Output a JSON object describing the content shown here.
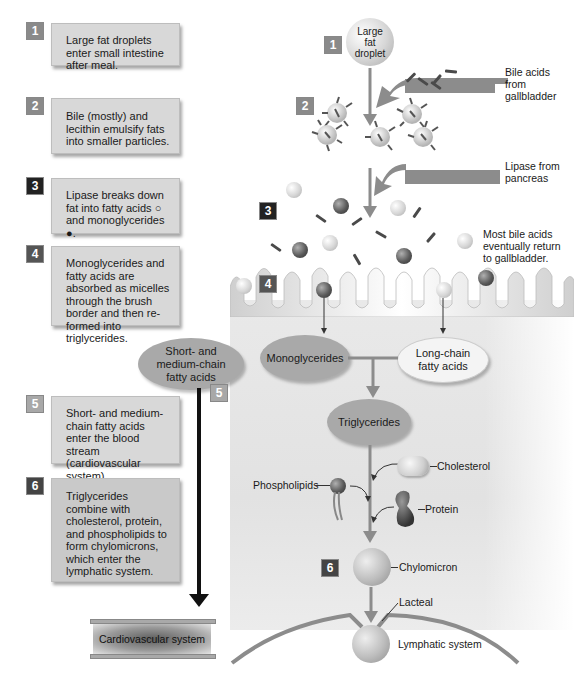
{
  "steps": [
    {
      "number": "1",
      "text": "Large fat droplets enter small intestine after meal.",
      "badge_color": "#8a8a8a"
    },
    {
      "number": "2",
      "text": "Bile (mostly) and lecithin emulsify fats into smaller particles.",
      "badge_color": "#8a8a8a"
    },
    {
      "number": "3",
      "text": "Lipase breaks down fat into fatty acids ○ and monoglycerides ●.",
      "badge_color": "#222222"
    },
    {
      "number": "4",
      "text": "Monoglycerides and fatty acids are absorbed as micelles through the brush border and then re-formed into triglycerides.",
      "badge_color": "#555555"
    },
    {
      "number": "5",
      "text": "Short- and medium-chain fatty acids enter the blood stream (cardiovascular system).",
      "badge_color": "#a8a8a8"
    },
    {
      "number": "6",
      "text": "Triglycerides combine with cholesterol, protein, and phospholipids to form chylomicrons, which enter the lymphatic system.",
      "badge_color": "#444444"
    }
  ],
  "diagram": {
    "droplet_label": "Large fat droplet",
    "bile_label": "Bile acids from gallbladder",
    "lipase_label": "Lipase from pancreas",
    "bile_return_label": "Most bile acids eventually return to gallbladder.",
    "short_chain_label": "Short- and medium-chain fatty acids",
    "monoglycerides_label": "Monoglycerides",
    "long_chain_label": "Long-chain fatty acids",
    "triglycerides_label": "Triglycerides",
    "cholesterol_label": "Cholesterol",
    "phospholipids_label": "Phospholipids",
    "protein_label": "Protein",
    "chylomicron_label": "Chylomicron",
    "lacteal_label": "Lacteal",
    "lymphatic_label": "Lymphatic system",
    "cardiovascular_label": "Cardiovascular system",
    "diagram_badges": [
      "1",
      "2",
      "3",
      "4",
      "5",
      "6"
    ]
  },
  "colors": {
    "box_fill": "#d8d8d8",
    "arrow_gray": "#8c8c8c",
    "ellipse_gray": "#a9a9a9",
    "ellipse_light": "#f4f4f4",
    "black_arrow": "#111111"
  }
}
